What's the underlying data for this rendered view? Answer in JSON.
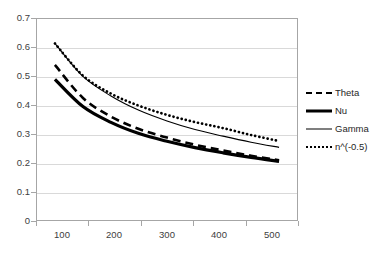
{
  "chart_data": {
    "type": "line",
    "title": "",
    "subtitle": "",
    "xlabel": "",
    "ylabel": "",
    "xlim": [
      100,
      500
    ],
    "ylim": [
      0,
      0.7
    ],
    "grid": true,
    "legend_position": "right",
    "x_tick_labels": [
      "100",
      "200",
      "300",
      "400",
      "500"
    ],
    "y_tick_labels": [
      "0",
      "0.1",
      "0.2",
      "0.3",
      "0.4",
      "0.5",
      "0.6",
      "0.7"
    ],
    "y_ticks": [
      0,
      0.1,
      0.2,
      0.3,
      0.4,
      0.5,
      0.6,
      0.7
    ],
    "x": [
      100,
      150,
      200,
      250,
      300,
      350,
      400,
      450,
      500
    ],
    "series": [
      {
        "name": "Theta",
        "style": "dashed",
        "color": "#000000",
        "width": 3,
        "values": [
          0.54,
          0.425,
          0.36,
          0.317,
          0.287,
          0.262,
          0.242,
          0.224,
          0.208
        ]
      },
      {
        "name": "Nu",
        "style": "solid-thick",
        "color": "#000000",
        "width": 3.4,
        "values": [
          0.49,
          0.395,
          0.34,
          0.301,
          0.274,
          0.252,
          0.234,
          0.218,
          0.204
        ]
      },
      {
        "name": "Gamma",
        "style": "solid-thin",
        "color": "#000000",
        "width": 1.2,
        "values": [
          0.615,
          0.5,
          0.432,
          0.382,
          0.345,
          0.315,
          0.292,
          0.271,
          0.253
        ]
      },
      {
        "name": "n^(-0.5)",
        "style": "dotted",
        "color": "#000000",
        "width": 3,
        "values": [
          0.615,
          0.503,
          0.44,
          0.398,
          0.366,
          0.341,
          0.32,
          0.296,
          0.275
        ]
      }
    ]
  },
  "legend": {
    "items": [
      {
        "label": "Theta"
      },
      {
        "label": "Nu"
      },
      {
        "label": "Gamma"
      },
      {
        "label": "n^(-0.5)"
      }
    ]
  },
  "axes": {
    "y_labels": [
      "0.7",
      "0.6",
      "0.5",
      "0.4",
      "0.3",
      "0.2",
      "0.1",
      "0"
    ],
    "x_labels": [
      "100",
      "200",
      "300",
      "400",
      "500"
    ]
  }
}
